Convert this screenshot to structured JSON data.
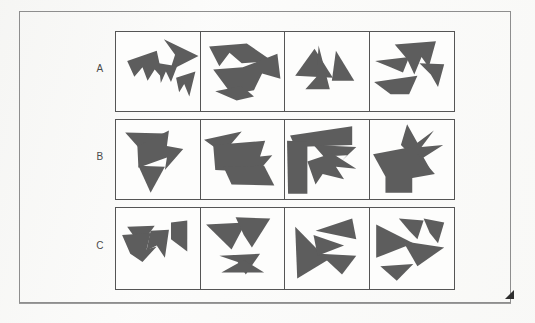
{
  "page": {
    "background_color": "#fbfbfa",
    "frame_color": "#8e8e8e",
    "shape_fill_color": "#5d5d5d",
    "grid_line_color": "#555555",
    "corner_marker": "corner-fold-triangle"
  },
  "rows": [
    {
      "label": "A"
    },
    {
      "label": "B"
    },
    {
      "label": "C"
    }
  ],
  "grid": {
    "row_count": 3,
    "column_count": 4,
    "cell_content_type": "abstract-polygon-cluster"
  },
  "cells": [
    {
      "id": "A1",
      "row": "A",
      "column": 1,
      "shape_count": 4,
      "polygons": [
        "47,7 81,23 53,37 58,22",
        "11,28 40,18 46,45 38,36 31,47 26,34 18,43",
        "42,30 60,33 54,48 49,38 44,49",
        "59,44 78,38 72,62 67,50 62,58"
      ]
    },
    {
      "id": "A2",
      "row": "A",
      "column": 2,
      "shape_count": 3,
      "polygons": [
        "8,14 45,11 70,28 40,30 28,20 18,33",
        "12,36 41,34 75,21 78,45 60,40 52,56 30,60",
        "14,57 40,52 52,62 35,66"
      ]
    },
    {
      "id": "A3",
      "row": "A",
      "column": 3,
      "shape_count": 3,
      "polygons": [
        "10,42 29,16 47,44",
        "33,13 44,55 20,55 31,43",
        "50,18 68,47 46,47"
      ]
    },
    {
      "id": "A4",
      "row": "A",
      "column": 4,
      "shape_count": 4,
      "polygons": [
        "24,12 64,9 57,34 50,24 43,41 36,26",
        "5,28 38,24 32,39 20,34",
        "48,30 72,31 66,53 59,41",
        "4,48 46,42 38,60 20,60"
      ]
    },
    {
      "id": "B1",
      "row": "B",
      "column": 1,
      "shape_count": 3,
      "polygons": [
        "9,12 49,13 30,35",
        "21,25 52,10 50,25 66,28 48,48 50,36 22,46",
        "22,44 48,45 34,70"
      ]
    },
    {
      "id": "B2",
      "row": "B",
      "column": 2,
      "shape_count": 3,
      "polygons": [
        "3,19 40,11 27,26 42,26 30,38",
        "12,24 63,20 58,35 70,34 56,50 14,48",
        "22,45 62,44 72,63 30,62"
      ]
    },
    {
      "id": "B3",
      "row": "B",
      "column": 3,
      "shape_count": 4,
      "polygons": [
        "5,15 66,6 66,24 10,26",
        "2,20 22,21 22,71 3,71",
        "28,24 70,26 55,40 61,34 38,35",
        "22,40 46,32 70,47 50,45 58,57 37,52 30,62"
      ]
    },
    {
      "id": "B4",
      "row": "B",
      "column": 4,
      "shape_count": 3,
      "polygons": [
        "36,4 46,22 62,10 50,26 71,24 52,36 60,50 40,34 30,24",
        "3,33 40,26 63,52 18,60",
        "15,55 41,55 41,70 15,70"
      ]
    },
    {
      "id": "C1",
      "row": "C",
      "column": 1,
      "shape_count": 4,
      "polygons": [
        "11,18 38,17 24,36",
        "6,26 34,24 30,40 40,37 26,52 14,44",
        "34,22 52,21 48,48 40,36 30,41",
        "54,14 70,12 70,42 54,30"
      ]
    },
    {
      "id": "C2",
      "row": "C",
      "column": 2,
      "shape_count": 4,
      "polygons": [
        "5,16 44,14 30,40",
        "34,9 68,10 50,38 42,26",
        "18,46 58,44 44,64 36,52",
        "20,62 42,50 62,62"
      ]
    },
    {
      "id": "C3",
      "row": "C",
      "column": 3,
      "shape_count": 4,
      "polygons": [
        "10,18 42,50 12,68",
        "30,22 66,10 70,30",
        "28,26 58,36 32,46",
        "34,44 70,46 56,64"
      ]
    },
    {
      "id": "C4",
      "row": "C",
      "column": 4,
      "shape_count": 4,
      "polygons": [
        "6,16 42,34 6,48",
        "28,10 52,12 46,30 38,22",
        "52,10 72,14 66,34 58,24",
        "32,32 72,38 46,56",
        "10,56 42,54 26,70"
      ]
    }
  ]
}
